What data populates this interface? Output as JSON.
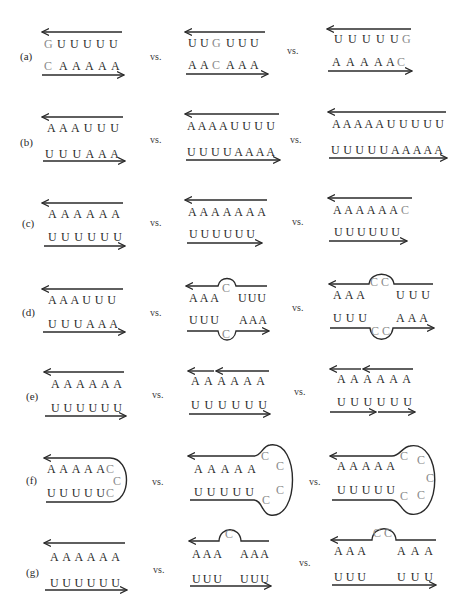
{
  "figure": {
    "vs_label": "vs.",
    "colors": {
      "ink": "#2a2a2a",
      "mismatch": "#8a8a8a",
      "background": "#ffffff"
    },
    "panels": [
      {
        "label": "(a)",
        "variants": [
          {
            "top": "GUUUUU",
            "bottom": "CAAAAA",
            "highlight": "terminal G·C at left end"
          },
          {
            "top": "UUGUUU",
            "bottom": "AACAAA",
            "highlight": "internal G·C"
          },
          {
            "top": "UUUUUG",
            "bottom": "AAAAAC",
            "highlight": "terminal G·C at right end"
          }
        ]
      },
      {
        "label": "(b)",
        "variants": [
          {
            "top": "AAAUUU",
            "bottom": "UUUAAA"
          },
          {
            "top": "AAAAUUUU",
            "bottom": "UUUUAAAA"
          },
          {
            "top": "AAAAAUUUUU",
            "bottom": "UUUUUAAAAA"
          }
        ]
      },
      {
        "label": "(c)",
        "variants": [
          {
            "top": "AAAAAA",
            "bottom": "UUUUUU"
          },
          {
            "top": "AAAAAAA",
            "bottom": "UUUUUU",
            "highlight": "dangling A"
          },
          {
            "top": "AAAAAAC",
            "bottom": "UUUUUU",
            "highlight": "dangling C"
          }
        ]
      },
      {
        "label": "(d)",
        "variants": [
          {
            "top": "AAAUUU",
            "bottom": "UUUAAA"
          },
          {
            "top_left": "AAA",
            "top_loop": "C",
            "top_right": "UUU",
            "bottom_left": "UUU",
            "bottom_loop": "C",
            "bottom_right": "AAA",
            "highlight": "1x1 internal loop"
          },
          {
            "top_left": "AAA",
            "top_loop": "CC",
            "top_right": "UUU",
            "bottom_left": "UUU",
            "bottom_loop": "CC",
            "bottom_right": "AAA",
            "highlight": "2x2 internal loop"
          }
        ]
      },
      {
        "label": "(e)",
        "variants": [
          {
            "top": "AAAAAA",
            "bottom": "UUUUUU",
            "nicks": "none"
          },
          {
            "top": "AAAAAA",
            "bottom": "UUUUUU",
            "nicks": "top strand nicked"
          },
          {
            "top": "AAAAAA",
            "bottom": "UUUUUU",
            "nicks": "both strands nicked"
          }
        ]
      },
      {
        "label": "(f)",
        "variants": [
          {
            "top": "AAAAA",
            "bottom": "UUUUU",
            "loop": "CCC",
            "highlight": "hairpin 3-C loop"
          },
          {
            "top": "AAAAA",
            "bottom": "UUUUU",
            "loop": "CCCC",
            "highlight": "hairpin 4-C loop"
          },
          {
            "top": "AAAAA",
            "bottom": "UUUUU",
            "loop": "CCCCC",
            "highlight": "hairpin 5-C loop"
          }
        ]
      },
      {
        "label": "(g)",
        "variants": [
          {
            "top": "AAAAAA",
            "bottom": "UUUUUU"
          },
          {
            "top_left": "AAA",
            "top_loop": "C",
            "top_right": "AAA",
            "bottom_left": "UUU",
            "bottom_right": "UUU",
            "highlight": "single C bulge"
          },
          {
            "top_left": "AAA",
            "top_loop": "CC",
            "top_right": "AAA",
            "bottom_left": "UUU",
            "bottom_right": "UUU",
            "highlight": "double C bulge"
          }
        ]
      }
    ]
  },
  "text": {
    "a": {
      "label": "(a)",
      "v1_top": [
        "G",
        "U",
        "U",
        "U",
        "U",
        "U"
      ],
      "v1_bot": [
        "C",
        "A",
        "A",
        "A",
        "A",
        "A"
      ],
      "v2_top": [
        "U",
        "U",
        "G",
        "U",
        "U",
        "U"
      ],
      "v2_bot": [
        "A",
        "A",
        "C",
        "A",
        "A",
        "A"
      ],
      "v3_top": [
        "U",
        "U",
        "U",
        "U",
        "U",
        "G"
      ],
      "v3_bot": [
        "A",
        "A",
        "A",
        "A",
        "A",
        "C"
      ]
    },
    "b": {
      "label": "(b)",
      "v1_top": "A A A U U U",
      "v1_bot": "U U U A A A",
      "v2_top": "A A A A U U U U",
      "v2_bot": "U U U U A A A A",
      "v3_top": "A A A A A U U U U U",
      "v3_bot": "U U U U U A A A A A"
    },
    "c": {
      "label": "(c)",
      "v1_top": "A A A A A A",
      "v1_bot": "U U U U U U",
      "v2_top": "A A A A A A A",
      "v2_bot": "U U U U U U",
      "v3_top": "A A A A A A",
      "v3_c": "C",
      "v3_bot": "U U U U U U"
    },
    "d": {
      "label": "(d)",
      "v1_top": "A A A U U U",
      "v1_bot": "U U U A A A",
      "v2_tl": "A A A",
      "v2_tr": "U U U",
      "v2_bl": "U U U",
      "v2_br": "A A A",
      "v2_loop": "C",
      "v3_tl": "A A A",
      "v3_tr": "U U U",
      "v3_bl": "U U U",
      "v3_br": "A A A",
      "v3_loop": "C C"
    },
    "e": {
      "label": "(e)",
      "v1_top": "A A A A A A",
      "v1_bot": "U U U U U U",
      "v2_top": "A A A A A A",
      "v2_bot": "U U U U U U",
      "v3_top": "A A A A A A",
      "v3_bot": "U U U U U U"
    },
    "f": {
      "label": "(f)",
      "v1_top": "A A A A A",
      "v1_bot": "U U U U U",
      "v2_top": "A A A A A",
      "v2_bot": "U U U U U",
      "v3_top": "A A A A A",
      "v3_bot": "U U U U U",
      "c": "C"
    },
    "g": {
      "label": "(g)",
      "v1_top": "A A A A A A",
      "v1_bot": "U U U U U U",
      "v2_tl": "A A A",
      "v2_tr": "A A A",
      "v2_bl": "U U U",
      "v2_br": "U U U",
      "v2_loop": "C",
      "v3_tl": "A A A",
      "v3_tr": "A A A",
      "v3_bl": "U U U",
      "v3_br": "U U U",
      "v3_loop": "C C"
    },
    "vs": "vs."
  }
}
